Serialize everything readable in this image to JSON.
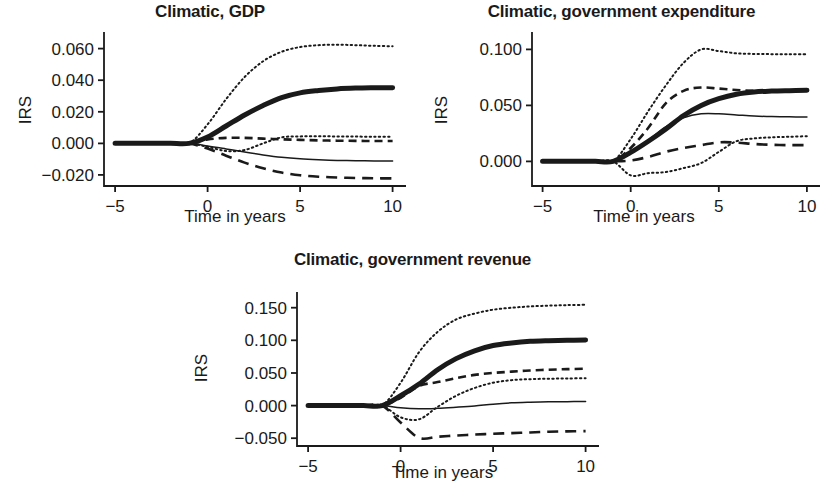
{
  "figure": {
    "background": "#ffffff",
    "ink": "#1a1a1a",
    "panel_count": 3
  },
  "chart_data": [
    {
      "id": "gdp",
      "type": "line",
      "title": "Climatic, GDP",
      "xlabel": "Time in years",
      "ylabel": "IRS",
      "xlim": [
        -5.6,
        10.4
      ],
      "ylim": [
        -0.027,
        0.068
      ],
      "xticks": [
        -5,
        0,
        5,
        10
      ],
      "xticklabels": [
        "−5",
        "0",
        "5",
        "10"
      ],
      "yticks": [
        -0.02,
        0.0,
        0.02,
        0.04,
        0.06
      ],
      "yticklabels": [
        "−0.020",
        "0.000",
        "0.020",
        "0.040",
        "0.060"
      ],
      "grid": false,
      "legend": "none",
      "x": [
        -5,
        -4,
        -3,
        -2,
        -1,
        0,
        1,
        2,
        3,
        4,
        5,
        6,
        7,
        8,
        9,
        10
      ],
      "series": [
        {
          "name": "point-estimate",
          "style": "solid-thick",
          "width": 5,
          "values": [
            0.0,
            0.0,
            0.0,
            0.0,
            0.0,
            0.004,
            0.011,
            0.018,
            0.024,
            0.029,
            0.032,
            0.0335,
            0.0345,
            0.035,
            0.0352,
            0.0353
          ]
        },
        {
          "name": "upper-outer-band",
          "style": "dotted",
          "width": 2,
          "values": [
            0.0,
            0.0,
            0.0,
            0.0,
            0.0,
            0.012,
            0.028,
            0.042,
            0.052,
            0.058,
            0.061,
            0.0622,
            0.0625,
            0.0622,
            0.0618,
            0.0615
          ]
        },
        {
          "name": "upper-inner-band",
          "style": "dashed",
          "width": 2.6,
          "values": [
            0.0,
            0.0,
            0.0,
            0.0,
            0.0,
            0.0025,
            0.0035,
            0.0035,
            0.003,
            0.0026,
            0.0022,
            0.0019,
            0.0017,
            0.0016,
            0.0015,
            0.0015
          ]
        },
        {
          "name": "lower-inner-band",
          "style": "solid-thin",
          "width": 1.5,
          "values": [
            0.0,
            0.0,
            0.0,
            0.0,
            0.0,
            -0.0016,
            -0.0035,
            -0.0055,
            -0.0073,
            -0.0088,
            -0.0098,
            -0.0104,
            -0.0108,
            -0.011,
            -0.0111,
            -0.0112
          ]
        },
        {
          "name": "lower-outer-band",
          "style": "dashed-long",
          "width": 2.6,
          "values": [
            0.0,
            0.0,
            0.0,
            0.0,
            0.0,
            -0.0033,
            -0.0078,
            -0.0122,
            -0.0158,
            -0.0185,
            -0.0202,
            -0.0211,
            -0.0216,
            -0.0219,
            -0.0221,
            -0.0222
          ]
        },
        {
          "name": "crossing-dotted-band",
          "style": "dotted",
          "width": 2,
          "values": [
            0.0,
            0.0,
            0.0,
            0.0,
            0.0,
            -0.0022,
            -0.0048,
            -0.0042,
            0.0,
            0.0038,
            0.0044,
            0.0045,
            0.0044,
            0.0043,
            0.0042,
            0.0042
          ]
        }
      ]
    },
    {
      "id": "expenditure",
      "type": "line",
      "title": "Climatic, government expenditure",
      "xlabel": "Time in years",
      "ylabel": "IRS",
      "xlim": [
        -5.6,
        10.4
      ],
      "ylim": [
        -0.022,
        0.112
      ],
      "xticks": [
        -5,
        0,
        5,
        10
      ],
      "xticklabels": [
        "−5",
        "0",
        "5",
        "10"
      ],
      "yticks": [
        0.0,
        0.05,
        0.1
      ],
      "yticklabels": [
        "0.000",
        "0.050",
        "0.100"
      ],
      "grid": false,
      "legend": "none",
      "x": [
        -5,
        -4,
        -3,
        -2,
        -1,
        0,
        1,
        2,
        3,
        4,
        5,
        6,
        7,
        8,
        9,
        10
      ],
      "series": [
        {
          "name": "point-estimate",
          "style": "solid-thick",
          "width": 5,
          "values": [
            0.0,
            0.0,
            0.0,
            0.0,
            0.0,
            0.008,
            0.018,
            0.029,
            0.041,
            0.05,
            0.056,
            0.06,
            0.062,
            0.0628,
            0.0632,
            0.0635
          ]
        },
        {
          "name": "upper-outer-band",
          "style": "dotted",
          "width": 2,
          "values": [
            0.0,
            0.0,
            0.0,
            0.0,
            0.0,
            0.02,
            0.045,
            0.068,
            0.088,
            0.1,
            0.0985,
            0.0965,
            0.096,
            0.0958,
            0.0957,
            0.0956
          ]
        },
        {
          "name": "upper-inner-band",
          "style": "dashed",
          "width": 2.6,
          "values": [
            0.0,
            0.0,
            0.0,
            0.0,
            0.0,
            0.012,
            0.03,
            0.052,
            0.063,
            0.066,
            0.065,
            0.0638,
            0.063,
            0.0628,
            0.0628,
            0.0632
          ]
        },
        {
          "name": "mid-thin-band",
          "style": "solid-thin",
          "width": 1.5,
          "values": [
            0.0,
            0.0,
            0.0,
            0.0,
            0.0,
            0.008,
            0.019,
            0.031,
            0.039,
            0.0425,
            0.0425,
            0.0415,
            0.0405,
            0.04,
            0.0398,
            0.0396
          ]
        },
        {
          "name": "lower-inner-band",
          "style": "dashed-long",
          "width": 2.6,
          "values": [
            0.0,
            0.0,
            0.0,
            0.0,
            0.0,
            0.0008,
            0.004,
            0.0086,
            0.012,
            0.0145,
            0.017,
            0.0168,
            0.0155,
            0.0148,
            0.0145,
            0.0145
          ]
        },
        {
          "name": "lower-outer-band",
          "style": "dotted",
          "width": 2,
          "values": [
            0.0,
            0.0,
            0.0,
            0.0,
            0.0,
            -0.0125,
            -0.0105,
            -0.0095,
            -0.006,
            -0.0015,
            0.0085,
            0.018,
            0.0205,
            0.0215,
            0.022,
            0.0225
          ]
        }
      ]
    },
    {
      "id": "revenue",
      "type": "line",
      "title": "Climatic, government revenue",
      "xlabel": "Time in years",
      "ylabel": "IRS",
      "xlim": [
        -5.6,
        10.4
      ],
      "ylim": [
        -0.062,
        0.168
      ],
      "xticks": [
        -5,
        0,
        5,
        10
      ],
      "xticklabels": [
        "−5",
        "0",
        "5",
        "10"
      ],
      "yticks": [
        -0.05,
        0.0,
        0.05,
        0.1,
        0.15
      ],
      "yticklabels": [
        "−0.050",
        "0.000",
        "0.050",
        "0.100",
        "0.150"
      ],
      "grid": false,
      "legend": "none",
      "x": [
        -5,
        -4,
        -3,
        -2,
        -1,
        0,
        1,
        2,
        3,
        4,
        5,
        6,
        7,
        8,
        9,
        10
      ],
      "series": [
        {
          "name": "point-estimate",
          "style": "solid-thick",
          "width": 5,
          "values": [
            0.0,
            0.0,
            0.0,
            0.0,
            0.0,
            0.015,
            0.033,
            0.055,
            0.072,
            0.084,
            0.092,
            0.096,
            0.0985,
            0.0995,
            0.1,
            0.1005
          ]
        },
        {
          "name": "upper-outer-band",
          "style": "dotted",
          "width": 2,
          "values": [
            0.0,
            0.0,
            0.0,
            0.0,
            0.0,
            0.035,
            0.082,
            0.113,
            0.132,
            0.141,
            0.147,
            0.15,
            0.152,
            0.1532,
            0.154,
            0.1545
          ]
        },
        {
          "name": "upper-inner-band",
          "style": "dashed",
          "width": 2.6,
          "values": [
            0.0,
            0.0,
            0.0,
            0.0,
            0.0,
            0.012,
            0.03,
            0.036,
            0.042,
            0.047,
            0.05,
            0.052,
            0.0538,
            0.055,
            0.0558,
            0.0565
          ]
        },
        {
          "name": "mid-dotted-band",
          "style": "dotted",
          "width": 2,
          "values": [
            0.0,
            0.0,
            0.0,
            0.0,
            0.0,
            -0.018,
            -0.021,
            -0.002,
            0.015,
            0.027,
            0.035,
            0.039,
            0.0405,
            0.0412,
            0.0415,
            0.042
          ]
        },
        {
          "name": "lower-inner-band",
          "style": "solid-thin",
          "width": 1.5,
          "values": [
            0.0,
            0.0,
            0.0,
            0.0,
            0.0,
            -0.0035,
            -0.005,
            -0.0042,
            -0.0025,
            -0.0005,
            0.0022,
            0.0042,
            0.0052,
            0.0058,
            0.006,
            0.0062
          ]
        },
        {
          "name": "lower-outer-band",
          "style": "dashed-long",
          "width": 2.6,
          "values": [
            0.0,
            0.0,
            0.0,
            0.0,
            0.0,
            -0.026,
            -0.0495,
            -0.0478,
            -0.046,
            -0.0445,
            -0.0432,
            -0.0422,
            -0.0412,
            -0.0402,
            -0.0396,
            -0.0392
          ]
        }
      ]
    }
  ]
}
